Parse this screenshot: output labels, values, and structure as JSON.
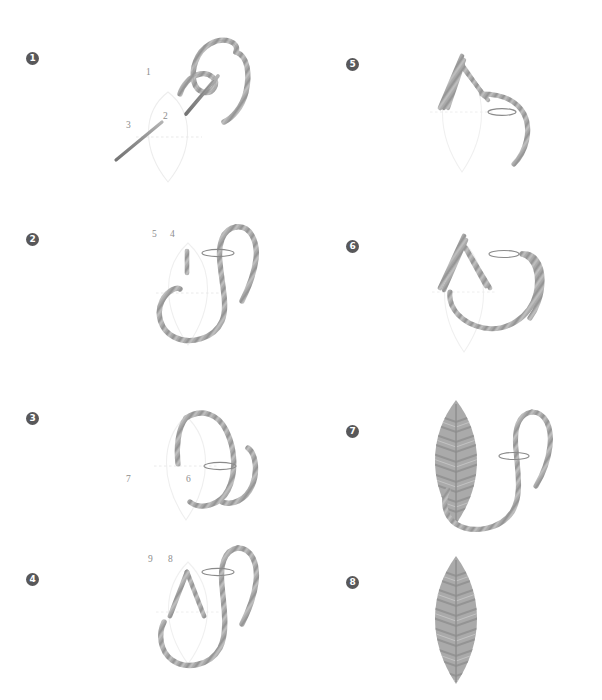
{
  "document": {
    "title": "Fishbone Leaf Stitch Step Diagram",
    "background_color": "#ffffff",
    "width": 602,
    "height": 700
  },
  "palette": {
    "badge_fill": "#58585a",
    "badge_text": "#ffffff",
    "thread": "#a6a6a6",
    "thread_dark": "#8f8f8f",
    "thread_light": "#c9c9c9",
    "needle": "#9a9a9a",
    "needle_dark": "#7d7d7d",
    "guide_outline": "#ededed",
    "guide_dotted": "#e3e3e3",
    "label_text": "#8d8d8d",
    "leaf_fill": "#a8a8a8",
    "leaf_shade": "#939393"
  },
  "columns": {
    "left_x": 26,
    "right_x": 346
  },
  "steps": [
    {
      "id": "step-1",
      "badge": "1",
      "badge_x": 26,
      "badge_y": 52,
      "panel_x": 90,
      "panel_y": 30,
      "labels": [
        {
          "text": "1",
          "x": 56,
          "y": 45
        },
        {
          "text": "2",
          "x": 73,
          "y": 89
        },
        {
          "text": "3",
          "x": 36,
          "y": 98
        }
      ],
      "description": "Needle enters at point 1, exits at 2, thread laid toward 3"
    },
    {
      "id": "step-2",
      "badge": "2",
      "badge_x": 26,
      "badge_y": 233,
      "panel_x": 90,
      "panel_y": 215,
      "labels": [
        {
          "text": "5",
          "x": 62,
          "y": 22
        },
        {
          "text": "4",
          "x": 80,
          "y": 22
        }
      ],
      "description": "Needle passes horizontally between points 5 and 4"
    },
    {
      "id": "step-3",
      "badge": "3",
      "badge_x": 26,
      "badge_y": 412,
      "panel_x": 90,
      "panel_y": 392,
      "labels": [
        {
          "text": "7",
          "x": 36,
          "y": 80
        },
        {
          "text": "6",
          "x": 96,
          "y": 80
        }
      ],
      "description": "Thread loops over the top, needle spans points 7 and 6"
    },
    {
      "id": "step-4",
      "badge": "4",
      "badge_x": 26,
      "badge_y": 573,
      "panel_x": 90,
      "panel_y": 540,
      "labels": [
        {
          "text": "9",
          "x": 58,
          "y": 22
        },
        {
          "text": "8",
          "x": 78,
          "y": 22
        }
      ],
      "description": "Crossed stitch anchored, needle spans points 9 and 8"
    },
    {
      "id": "step-5",
      "badge": "5",
      "badge_x": 346,
      "badge_y": 58,
      "panel_x": 400,
      "panel_y": 40,
      "labels": [],
      "description": "Several crossed stitches built up at the leaf tip"
    },
    {
      "id": "step-6",
      "badge": "6",
      "badge_x": 346,
      "badge_y": 240,
      "panel_x": 400,
      "panel_y": 222,
      "labels": [],
      "description": "Stitches continue, thread loops below the needle"
    },
    {
      "id": "step-7",
      "badge": "7",
      "badge_x": 346,
      "badge_y": 425,
      "panel_x": 400,
      "panel_y": 392,
      "labels": [],
      "description": "Leaf partially filled with fishbone stitches, needle still in work"
    },
    {
      "id": "step-8",
      "badge": "8",
      "badge_x": 346,
      "badge_y": 576,
      "panel_x": 400,
      "panel_y": 550,
      "labels": [],
      "description": "Completed fishbone leaf stitch"
    }
  ]
}
